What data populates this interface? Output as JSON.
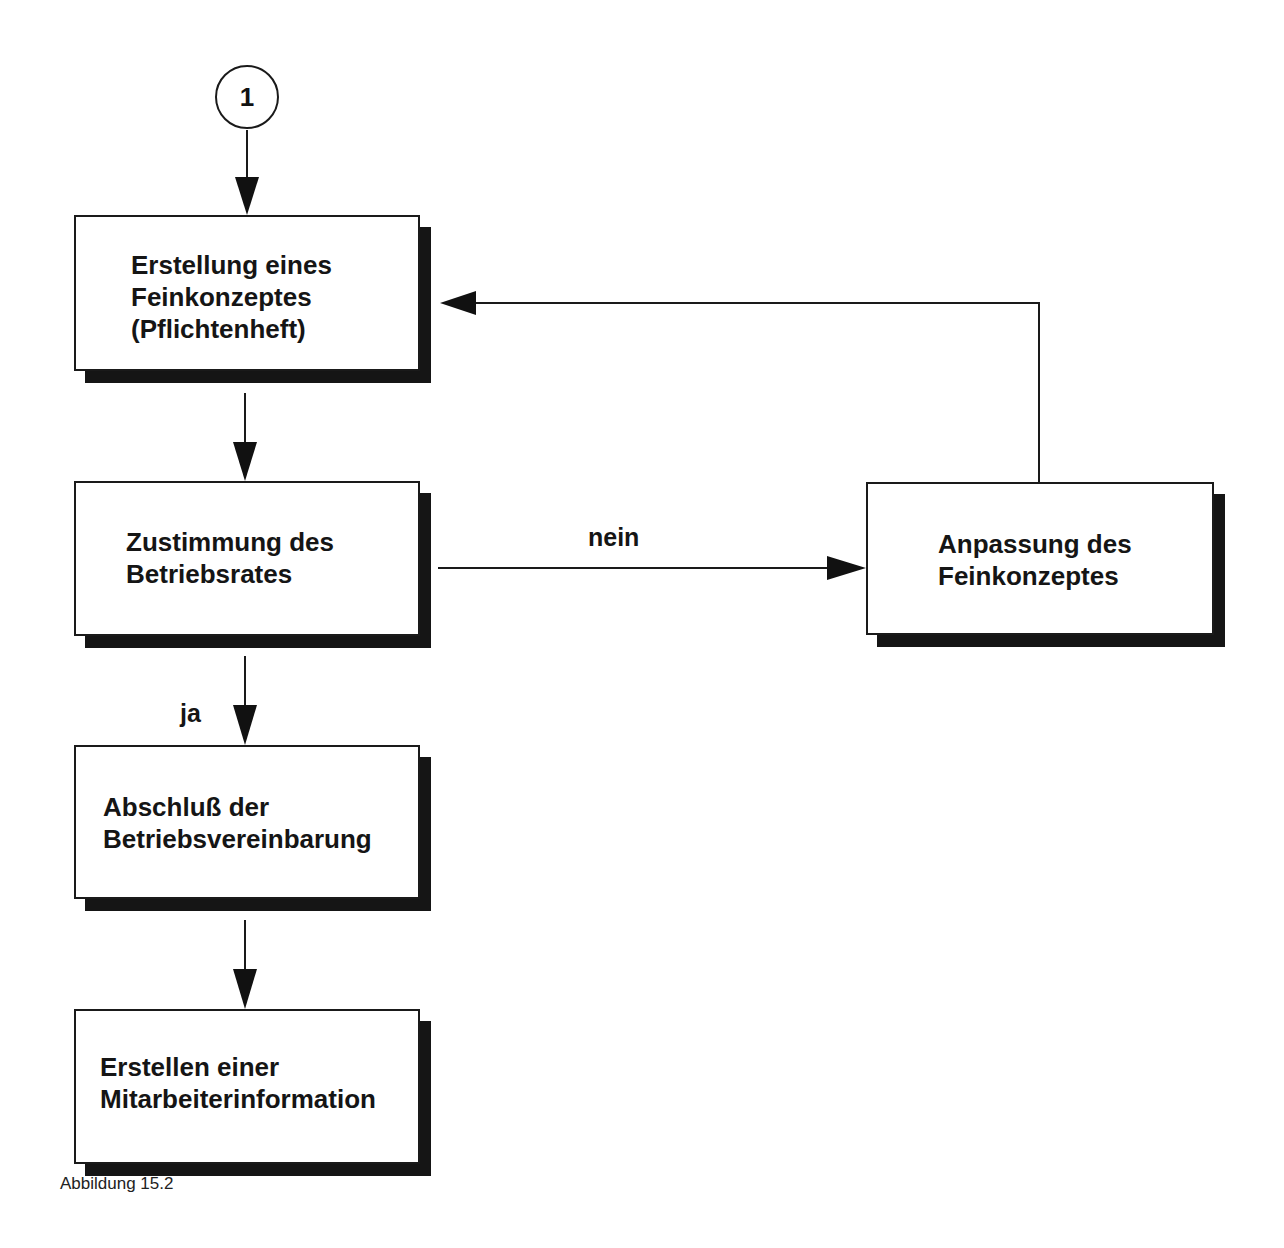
{
  "diagram": {
    "type": "flowchart",
    "start_connector": {
      "label": "1"
    },
    "nodes": [
      {
        "id": "feinkonzept",
        "label": "Erstellung eines\nFeinkonzeptes\n(Pflichtenheft)"
      },
      {
        "id": "zustimmung",
        "label": "Zustimmung des\nBetriebsrates"
      },
      {
        "id": "anpassung",
        "label": "Anpassung des\nFeinkonzeptes"
      },
      {
        "id": "abschluss",
        "label": "Abschluß der\nBetriebsvereinbarung"
      },
      {
        "id": "mitarbeiterinfo",
        "label": "Erstellen einer\nMitarbeiterinformation"
      }
    ],
    "edges": [
      {
        "from": "1",
        "to": "feinkonzept",
        "label": ""
      },
      {
        "from": "feinkonzept",
        "to": "zustimmung",
        "label": ""
      },
      {
        "from": "zustimmung",
        "to": "anpassung",
        "label": "nein"
      },
      {
        "from": "anpassung",
        "to": "feinkonzept",
        "label": ""
      },
      {
        "from": "zustimmung",
        "to": "abschluss",
        "label": "ja"
      },
      {
        "from": "abschluss",
        "to": "mitarbeiterinfo",
        "label": ""
      }
    ],
    "edge_labels": {
      "no": "nein",
      "yes": "ja"
    },
    "caption": "Abbildung 15.2"
  },
  "colors": {
    "line": "#1a1a1a",
    "shadow": "#151515",
    "background": "#ffffff"
  }
}
